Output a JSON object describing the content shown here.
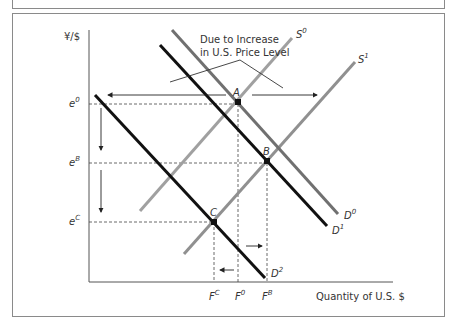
{
  "diagram": {
    "y_axis_label": "¥/$",
    "x_axis_label": "Quantity of U.S. $",
    "annotation_line1": "Due to Increase",
    "annotation_line2": "in U.S. Price Level",
    "curves": [
      {
        "id": "S0",
        "base": "S",
        "sup": "0",
        "color": "#9a9a9a"
      },
      {
        "id": "S1",
        "base": "S",
        "sup": "1",
        "color": "#8a8a8a"
      },
      {
        "id": "D0",
        "base": "D",
        "sup": "0",
        "color": "#6f6f6f"
      },
      {
        "id": "D1",
        "base": "D",
        "sup": "1",
        "color": "#111111"
      },
      {
        "id": "D2",
        "base": "D",
        "sup": "2",
        "color": "#111111"
      }
    ],
    "points": [
      {
        "id": "A",
        "label": "A"
      },
      {
        "id": "B",
        "label": "B"
      },
      {
        "id": "C",
        "label": "C"
      }
    ],
    "y_ticks": [
      {
        "base": "e",
        "sup": "0"
      },
      {
        "base": "e",
        "sup": "B"
      },
      {
        "base": "e",
        "sup": "C"
      }
    ],
    "x_ticks": [
      {
        "base": "F",
        "sup": "C"
      },
      {
        "base": "F",
        "sup": "0"
      },
      {
        "base": "F",
        "sup": "B"
      }
    ]
  }
}
